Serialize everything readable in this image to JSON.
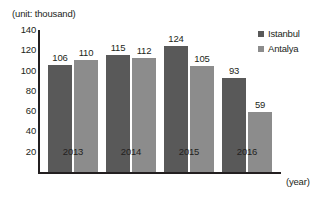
{
  "chart_data": {
    "type": "bar",
    "title": "(unit: thousand)",
    "xlabel": "(year)",
    "ylabel": "",
    "categories": [
      "2013",
      "2014",
      "2015",
      "2016"
    ],
    "series": [
      {
        "name": "Istanbul",
        "color": "#595959",
        "values": [
          106,
          115,
          124,
          93
        ]
      },
      {
        "name": "Antalya",
        "color": "#8c8c8c",
        "values": [
          110,
          112,
          105,
          59
        ]
      }
    ],
    "ylim": [
      0,
      140
    ],
    "ytick_values": [
      140,
      120,
      100,
      80,
      60,
      40,
      20
    ],
    "ytick_labels": [
      "140",
      "120",
      "100",
      "80",
      "60",
      "40",
      "20"
    ],
    "grid": false,
    "legend_position": "top-right",
    "data_labels": [
      [
        "106",
        "115",
        "124",
        "93"
      ],
      [
        "110",
        "112",
        "105",
        "59"
      ]
    ],
    "background_color": "#ffffff",
    "axis_color": "#231f20"
  },
  "legend": {
    "entries": [
      {
        "label": "Istanbul"
      },
      {
        "label": "Antalya"
      }
    ]
  }
}
